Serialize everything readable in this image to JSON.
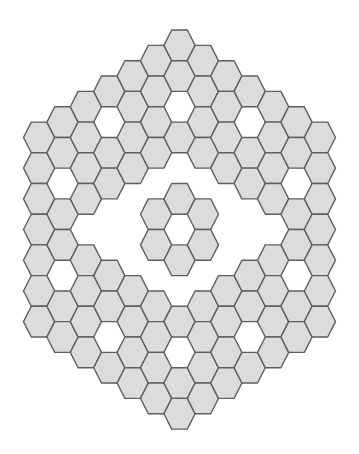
{
  "colors": {
    "cell_fill": "#dcdcdc",
    "cell_stroke": "#5f5f5f",
    "background": "#ffffff"
  },
  "board": {
    "shape": "hexagon",
    "orientation": "flat-top",
    "coordinate_system": "axial (q, r)",
    "radius": 6,
    "total_positions": 127,
    "empty_cells": [
      [
        0,
        -4
      ],
      [
        0,
        -2
      ],
      [
        0,
        0
      ],
      [
        0,
        2
      ],
      [
        0,
        4
      ],
      [
        -1,
        -1
      ],
      [
        -1,
        2
      ],
      [
        1,
        -2
      ],
      [
        1,
        1
      ],
      [
        -2,
        0
      ],
      [
        -2,
        1
      ],
      [
        -2,
        2
      ],
      [
        2,
        -2
      ],
      [
        2,
        -1
      ],
      [
        2,
        0
      ],
      [
        -3,
        -2
      ],
      [
        -3,
        1
      ],
      [
        -3,
        2
      ],
      [
        -3,
        5
      ],
      [
        3,
        -5
      ],
      [
        3,
        -2
      ],
      [
        3,
        -1
      ],
      [
        3,
        2
      ],
      [
        -4,
        2
      ],
      [
        4,
        -2
      ],
      [
        -5,
        1
      ],
      [
        -5,
        4
      ],
      [
        5,
        -4
      ],
      [
        5,
        -1
      ]
    ]
  }
}
